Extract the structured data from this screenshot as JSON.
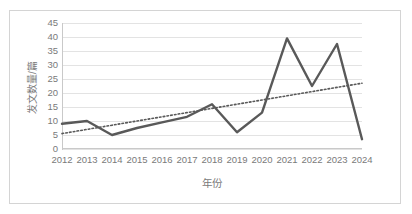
{
  "chart_data": {
    "type": "line",
    "title": "",
    "xlabel": "年份",
    "ylabel": "发文数量/篇",
    "categories": [
      "2012",
      "2013",
      "2014",
      "2015",
      "2016",
      "2017",
      "2018",
      "2019",
      "2020",
      "2021",
      "2022",
      "2023",
      "2024"
    ],
    "yticks": [
      0,
      5,
      10,
      15,
      20,
      25,
      30,
      35,
      40,
      45
    ],
    "ylim": [
      0,
      45
    ],
    "grid": true,
    "legend": "none",
    "series": [
      {
        "name": "发文数量",
        "kind": "line",
        "color": "#595959",
        "style": "solid",
        "values": [
          9,
          10,
          5,
          7.5,
          9.5,
          11.5,
          16,
          6,
          13,
          39.5,
          22.5,
          37.5,
          3.5
        ]
      },
      {
        "name": "线性趋势线",
        "kind": "trendline",
        "color": "#595959",
        "style": "dotted",
        "values": [
          5.5,
          7,
          8.5,
          10,
          11.5,
          13,
          14.5,
          16,
          17.5,
          19,
          20.5,
          22,
          23.5
        ]
      }
    ]
  },
  "axes": {
    "y_tick_labels": [
      "45",
      "40",
      "35",
      "30",
      "25",
      "20",
      "15",
      "10",
      "5",
      "0"
    ],
    "x_tick_labels": [
      "2012",
      "2013",
      "2014",
      "2015",
      "2016",
      "2017",
      "2018",
      "2019",
      "2020",
      "2021",
      "2022",
      "2023",
      "2024"
    ],
    "y_title": "发文数量/篇",
    "x_title": "年份"
  },
  "colors": {
    "series_line": "#595959",
    "trendline": "#595959",
    "gridline": "#e3e3e3",
    "axis": "#c9c9c9",
    "tick_text": "#7a7a7a",
    "frame_border": "#d4d4d4",
    "background": "#ffffff"
  }
}
